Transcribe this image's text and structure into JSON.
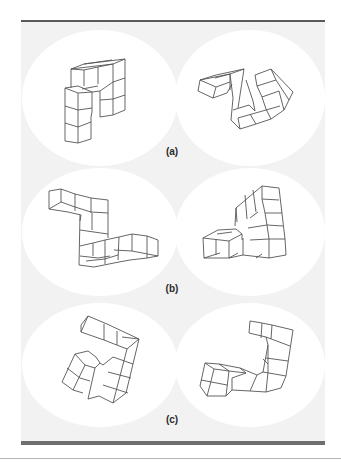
{
  "figure": {
    "rows": [
      {
        "label": "(a)",
        "label_y": 146,
        "left_figure": "pair-a-left",
        "right_figure": "pair-a-right"
      },
      {
        "label": "(b)",
        "label_y": 283,
        "left_figure": "pair-b-left",
        "right_figure": "pair-b-right"
      },
      {
        "label": "(c)",
        "label_y": 414,
        "left_figure": "pair-c-left",
        "right_figure": "pair-c-right"
      }
    ],
    "colors": {
      "panel_bg": "#f2f2f2",
      "circle_bg": "#ffffff",
      "stroke": "#555555",
      "rule": "#5a5a5a"
    }
  }
}
